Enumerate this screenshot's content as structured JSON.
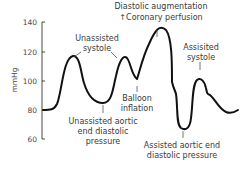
{
  "diagram": {
    "y_axis": {
      "label": "mmHg",
      "ticks": [
        "140",
        "120",
        "100",
        "80",
        "60"
      ]
    },
    "annotations": {
      "unassisted_systole": [
        "Unassisted",
        "systole"
      ],
      "diastolic_augmentation": [
        "Diastolic augmentation",
        "↑Coronary perfusion"
      ],
      "assisted_systole": [
        "Assisited",
        "systole"
      ],
      "balloon_inflation": [
        "Balloon",
        "inflation"
      ],
      "unassisted_aedp": [
        "Unassisted aortic",
        "end diastolic",
        "pressure"
      ],
      "assisted_aedp": [
        "Assisted aortic end",
        "diastolic pressure"
      ]
    },
    "colors": {
      "curve": "#111111",
      "axis": "#333333",
      "text": "#3a3a3a"
    }
  }
}
